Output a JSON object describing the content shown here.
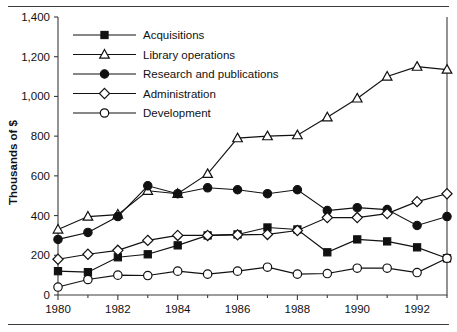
{
  "chart_data": {
    "type": "line",
    "title": "",
    "xlabel": "",
    "ylabel": "Thousands of $",
    "x": [
      1980,
      1981,
      1982,
      1983,
      1984,
      1985,
      1986,
      1987,
      1988,
      1989,
      1990,
      1991,
      1992,
      1993
    ],
    "xlim": [
      1980,
      1993
    ],
    "ylim": [
      0,
      1400
    ],
    "ytick_values": [
      0,
      200,
      400,
      600,
      800,
      1000,
      1200,
      1400
    ],
    "ytick_labels": [
      "0",
      "200",
      "400",
      "600",
      "800",
      "1,000",
      "1,200",
      "1,400"
    ],
    "xtick_values": [
      1980,
      1982,
      1984,
      1986,
      1988,
      1990,
      1992
    ],
    "xtick_labels": [
      "1980",
      "1982",
      "1984",
      "1986",
      "1988",
      "1990",
      "1992"
    ],
    "xminor_values": [
      1981,
      1983,
      1985,
      1987,
      1989,
      1991,
      1993
    ],
    "grid": false,
    "legend_position": "upper-left-inside",
    "series": [
      {
        "name": "Acquisitions",
        "marker": "filled-square",
        "values": [
          120,
          115,
          190,
          205,
          250,
          300,
          305,
          340,
          330,
          215,
          280,
          270,
          240,
          185
        ]
      },
      {
        "name": "Library operations",
        "marker": "open-triangle",
        "values": [
          330,
          395,
          405,
          525,
          510,
          610,
          790,
          800,
          805,
          895,
          990,
          1100,
          1150,
          1135
        ]
      },
      {
        "name": "Research and publications",
        "marker": "filled-circle",
        "values": [
          280,
          315,
          395,
          550,
          510,
          540,
          530,
          510,
          530,
          425,
          440,
          430,
          350,
          395
        ]
      },
      {
        "name": "Administration",
        "marker": "open-diamond",
        "values": [
          180,
          205,
          225,
          275,
          300,
          300,
          303,
          305,
          325,
          390,
          390,
          410,
          470,
          510
        ]
      },
      {
        "name": "Development",
        "marker": "open-circle",
        "values": [
          40,
          78,
          100,
          98,
          120,
          105,
          120,
          140,
          105,
          108,
          135,
          135,
          113,
          185
        ]
      }
    ]
  },
  "legend": {
    "entries": [
      {
        "label": "Acquisitions",
        "marker": "filled-square"
      },
      {
        "label": "Library operations",
        "marker": "open-triangle"
      },
      {
        "label": "Research and publications",
        "marker": "filled-circle"
      },
      {
        "label": "Administration",
        "marker": "open-diamond"
      },
      {
        "label": "Development",
        "marker": "open-circle"
      }
    ]
  },
  "axes": {
    "y_title": "Thousands of $"
  }
}
